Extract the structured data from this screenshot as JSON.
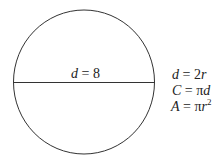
{
  "diagram": {
    "type": "circle-diameter",
    "shape": "circle",
    "diameter_label": {
      "var": "d",
      "eq": " = ",
      "value": "8"
    },
    "formulas": [
      {
        "lhs": "d",
        "rhs_num": "2",
        "rhs_var": "r",
        "text": "d = 2r"
      },
      {
        "lhs": "C",
        "rhs_num": "π",
        "rhs_var": "d",
        "text": "C = πd"
      },
      {
        "lhs": "A",
        "rhs_num": "π",
        "rhs_var": "r",
        "sup": "2",
        "text": "A = πr²"
      }
    ],
    "colors": {
      "stroke": "#333333",
      "text": "#222222",
      "background": "#ffffff"
    }
  }
}
